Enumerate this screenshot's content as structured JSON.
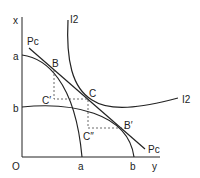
{
  "diagram": {
    "axes": {
      "vertical_label": "x",
      "horizontal_label": "y",
      "origin_label": "O"
    },
    "curves": {
      "production_a": {
        "label_axis_x": "a",
        "label_axis_y": "a"
      },
      "production_b": {
        "label_axis_x": "b",
        "label_axis_y": "b"
      },
      "price_line": {
        "label_start": "Pc",
        "label_end": "Pc"
      },
      "indifference": {
        "label_top": "I2",
        "label_right": "I2"
      }
    },
    "points": {
      "B": "B",
      "C": "C",
      "C_prime": "C′",
      "C_double_prime": "C″",
      "B_prime": "B′"
    },
    "colors": {
      "line": "#222222",
      "dashed": "#444444"
    }
  }
}
